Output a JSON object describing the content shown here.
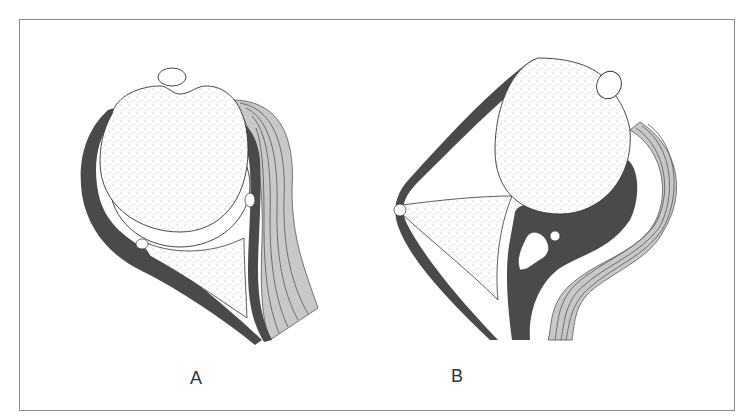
{
  "figure": {
    "panels": [
      {
        "id": "A",
        "label": "A"
      },
      {
        "id": "B",
        "label": "B"
      }
    ],
    "colors": {
      "capsule": "#4a4a4a",
      "muscle": "#c8c8c8",
      "muscle_lines": "#555555",
      "bone": "#ffffff",
      "outline": "#333333",
      "frame": "#8a8a8a"
    }
  }
}
